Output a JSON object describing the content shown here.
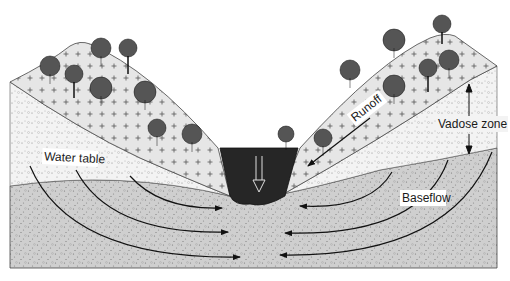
{
  "diagram": {
    "type": "cross-section",
    "labels": {
      "runoff": "Runoff",
      "vadose_zone": "Vadose zone",
      "water_table": "Water table",
      "baseflow": "Baseflow"
    },
    "layers": [
      {
        "name": "vegetated-soil",
        "pattern": "plus-dots",
        "color": "#e4e4e4"
      },
      {
        "name": "vadose-zone",
        "pattern": "fine-dots",
        "color": "#f4f4f4"
      },
      {
        "name": "saturated-zone",
        "pattern": "dense-dots",
        "color": "#cfcfcf"
      },
      {
        "name": "stream-channel",
        "pattern": "solid",
        "color": "#262626"
      }
    ],
    "colors": {
      "outline": "#333333",
      "arrow": "#111111"
    }
  }
}
